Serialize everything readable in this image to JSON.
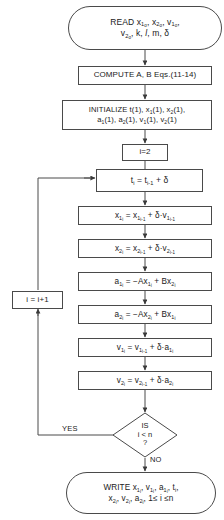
{
  "diagram": {
    "type": "flowchart",
    "stroke_color": "#4a4a4a",
    "text_color": "#1a1a1a",
    "background": "#ffffff"
  },
  "nodes": {
    "read": {
      "shape": "terminator",
      "line1_pre": "READ x",
      "line1": "READ x1o, x2o, v1o,",
      "line2": "v2o, k, l, m, δ"
    },
    "compute": {
      "shape": "process",
      "text": "COMPUTE A, B Eqs.(11-14)"
    },
    "initialize": {
      "shape": "process",
      "line1": "INITIALIZE t(1), x1(1), x2(1),",
      "line2": "a1(1), a2(1), v1(1), v2(1)"
    },
    "init_i": {
      "shape": "process",
      "text": "i=2"
    },
    "step_t": {
      "shape": "process",
      "text": "ti = ti-1 + δ"
    },
    "step_x1": {
      "shape": "process",
      "text": "x1i = x1i-1 + δ·v1i-1"
    },
    "step_x2": {
      "shape": "process",
      "text": "x2i = x2i-1 + δ·v2i-1"
    },
    "step_a1": {
      "shape": "process",
      "text": "a1i = −Ax1i + Bx2i"
    },
    "step_a2": {
      "shape": "process",
      "text": "a2i = −Ax2i + Bx1i"
    },
    "step_v1": {
      "shape": "process",
      "text": "v1i = v1i-1 + δ·a1i"
    },
    "step_v2": {
      "shape": "process",
      "text": "v2i = v2i-1 + δ·a2i"
    },
    "increment": {
      "shape": "process",
      "text": "i = i+1"
    },
    "decision": {
      "shape": "diamond",
      "line1": "IS",
      "line2": "i < n",
      "line3": "?"
    },
    "write": {
      "shape": "terminator",
      "line1": "WRITE x1i, v1i, a1i, ti,",
      "line2": "x2i, v2i, a2i, 1≤ i ≤n"
    }
  },
  "edge_labels": {
    "yes": "YES",
    "no": "NO"
  }
}
